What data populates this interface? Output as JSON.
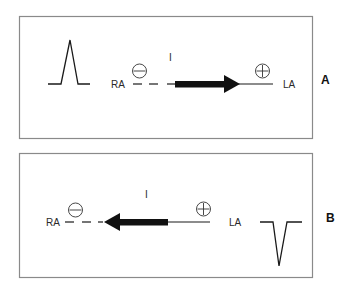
{
  "figure": {
    "colors": {
      "line": "#1a1a1a",
      "box_border": "#8a8a8a",
      "background": "#ffffff"
    }
  },
  "panels": [
    {
      "id": "A",
      "panel_label": "A",
      "lead_label": "I",
      "negative_electrode": {
        "label": "RA",
        "polarity_symbol": "minus"
      },
      "positive_electrode": {
        "label": "LA",
        "polarity_symbol": "plus"
      },
      "arrow_direction": "toward LA (right)",
      "waveform": "positive (upright) deflection"
    },
    {
      "id": "B",
      "panel_label": "B",
      "lead_label": "I",
      "negative_electrode": {
        "label": "RA",
        "polarity_symbol": "minus"
      },
      "positive_electrode": {
        "label": "LA",
        "polarity_symbol": "plus"
      },
      "arrow_direction": "toward RA (left)",
      "waveform": "negative (inverted) deflection"
    }
  ]
}
